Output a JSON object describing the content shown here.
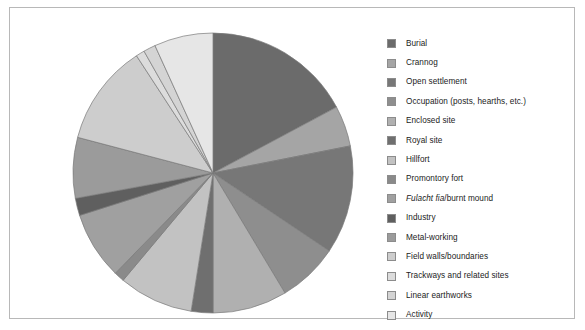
{
  "figure": {
    "background_color": "#ffffff",
    "frame_color": "#b8b8b8"
  },
  "chart_data": {
    "type": "pie",
    "title": "",
    "subtitle": "",
    "xlabel": "",
    "ylabel": "",
    "grid": false,
    "legend_position": "right",
    "start_angle_deg": 0,
    "direction": "clockwise",
    "center_px": [
      203,
      165
    ],
    "radius_px": 141,
    "categories": [
      "Burial",
      "Crannog",
      "Open settlement",
      "Occupation (posts, hearths, etc.)",
      "Enclosed site",
      "Royal site",
      "Hillfort",
      "Promontory fort",
      "Fulacht fia/burnt mound",
      "Industry",
      "Metal-working",
      "Field walls/boundaries",
      "Trackways and related sites",
      "Linear earthworks",
      "Activity"
    ],
    "values": [
      17.2,
      4.7,
      12.5,
      7.0,
      8.6,
      2.5,
      8.6,
      1.2,
      7.8,
      2.0,
      7.0,
      11.7,
      1.0,
      1.4,
      6.8
    ],
    "colors": [
      "#6b6b6b",
      "#a5a5a5",
      "#777777",
      "#8e8e8e",
      "#b0b0b0",
      "#6f6f6f",
      "#c2c2c2",
      "#8a8a8a",
      "#a0a0a0",
      "#5f5f5f",
      "#9b9b9b",
      "#cdcdcd",
      "#dcdcdc",
      "#d4d4d4",
      "#e6e6e6"
    ],
    "slice_edge_color": "#7a7a7a"
  },
  "legend": {
    "items": [
      {
        "label": "Burial",
        "label_html": "Burial",
        "swatch": "#6b6b6b"
      },
      {
        "label": "Crannog",
        "label_html": "Crannog",
        "swatch": "#a5a5a5"
      },
      {
        "label": "Open settlement",
        "label_html": "Open settlement",
        "swatch": "#777777"
      },
      {
        "label": "Occupation (posts, hearths, etc.)",
        "label_html": "Occupation (posts, hearths, etc.)",
        "swatch": "#8e8e8e"
      },
      {
        "label": "Enclosed site",
        "label_html": "Enclosed site",
        "swatch": "#b0b0b0"
      },
      {
        "label": "Royal site",
        "label_html": "Royal site",
        "swatch": "#6f6f6f"
      },
      {
        "label": "Hillfort",
        "label_html": "Hillfort",
        "swatch": "#c2c2c2"
      },
      {
        "label": "Promontory fort",
        "label_html": "Promontory fort",
        "swatch": "#8a8a8a"
      },
      {
        "label": "Fulacht fia/burnt mound",
        "label_html": "<i>Fulacht fia</i>/burnt mound",
        "swatch": "#a0a0a0"
      },
      {
        "label": "Industry",
        "label_html": "Industry",
        "swatch": "#5f5f5f"
      },
      {
        "label": "Metal-working",
        "label_html": "Metal-working",
        "swatch": "#9b9b9b"
      },
      {
        "label": "Field walls/boundaries",
        "label_html": "Field walls/boundaries",
        "swatch": "#cdcdcd"
      },
      {
        "label": "Trackways and related sites",
        "label_html": "Trackways and related sites",
        "swatch": "#dcdcdc"
      },
      {
        "label": "Linear earthworks",
        "label_html": "Linear earthworks",
        "swatch": "#d4d4d4"
      },
      {
        "label": "Activity",
        "label_html": "Activity",
        "swatch": "#e6e6e6"
      }
    ]
  }
}
